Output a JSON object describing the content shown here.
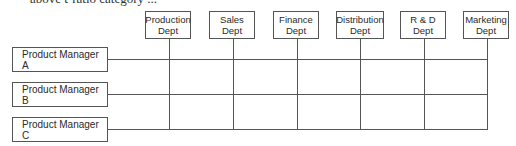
{
  "header": {
    "cutoff_text": "above t-ratio category ..."
  },
  "departments": [
    {
      "label": "Production\nDept",
      "x": 145
    },
    {
      "label": "Sales\nDept",
      "x": 209
    },
    {
      "label": "Finance\nDept",
      "x": 273
    },
    {
      "label": "Distribution\nDept",
      "x": 336
    },
    {
      "label": "R & D\nDept",
      "x": 400
    },
    {
      "label": "Marketing\nDept",
      "x": 463
    }
  ],
  "product_managers": [
    {
      "label": "Product Manager A"
    },
    {
      "label": "Product Manager B"
    },
    {
      "label": "Product Manager C"
    }
  ],
  "colors": {
    "line": "#555555",
    "text": "#2a2a2a",
    "background": "#ffffff"
  }
}
